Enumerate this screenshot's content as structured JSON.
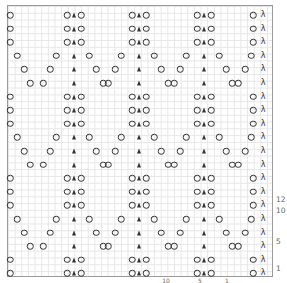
{
  "chart_title": "",
  "legend": {
    "O": "yarn over (circle)",
    "A": "centered double decrease (filled triangle)",
    "λ": "decrease (lambda)"
  },
  "grid": {
    "rows": 20,
    "rows_per_repeat": 6,
    "col_px": 6.65,
    "row_px": 13.6
  },
  "row_types": {
    "P": [
      [
        "O",
        2
      ],
      [
        "O",
        59
      ],
      [
        "A",
        66
      ],
      [
        "O",
        73
      ],
      [
        "O",
        124
      ],
      [
        "A",
        131
      ],
      [
        "O",
        138
      ],
      [
        "O",
        189
      ],
      [
        "A",
        196
      ],
      [
        "O",
        203
      ],
      [
        "O",
        245
      ],
      [
        "λ",
        255
      ]
    ],
    "Q1": [
      [
        "O",
        9
      ],
      [
        "O",
        48
      ],
      [
        "A",
        66
      ],
      [
        "O",
        81
      ],
      [
        "O",
        113
      ],
      [
        "A",
        131
      ],
      [
        "O",
        146
      ],
      [
        "O",
        178
      ],
      [
        "A",
        196
      ],
      [
        "O",
        211
      ],
      [
        "O",
        243
      ],
      [
        "λ",
        255
      ]
    ],
    "Q2": [
      [
        "O",
        16
      ],
      [
        "O",
        42
      ],
      [
        "A",
        66
      ],
      [
        "O",
        88
      ],
      [
        "O",
        107
      ],
      [
        "A",
        131
      ],
      [
        "O",
        153
      ],
      [
        "O",
        172
      ],
      [
        "A",
        196
      ],
      [
        "O",
        218
      ],
      [
        "O",
        237
      ],
      [
        "λ",
        255
      ]
    ],
    "Q3": [
      [
        "O",
        22
      ],
      [
        "O",
        35
      ],
      [
        "A",
        66
      ],
      [
        "O",
        95
      ],
      [
        "O",
        100
      ],
      [
        "A",
        131
      ],
      [
        "O",
        160
      ],
      [
        "O",
        166
      ],
      [
        "A",
        196
      ],
      [
        "O",
        224
      ],
      [
        "O",
        230
      ],
      [
        "λ",
        255
      ]
    ]
  },
  "rows": [
    "P",
    "P",
    "P",
    "Q1",
    "Q2",
    "Q3",
    "P",
    "P",
    "P",
    "Q1",
    "Q2",
    "Q3",
    "P",
    "P",
    "P",
    "Q1",
    "Q2",
    "Q3",
    "P",
    "P"
  ],
  "right_labels": [
    {
      "text": "12",
      "row": 13.6
    },
    {
      "text": "10",
      "row": 14.4
    },
    {
      "text": "5",
      "row": 16.7
    },
    {
      "text": "1",
      "row": 18.7
    }
  ],
  "bottom_labels": [
    {
      "text": "10",
      "x": 166
    },
    {
      "text": "5",
      "x": 200
    },
    {
      "text": "1",
      "x": 227
    }
  ]
}
